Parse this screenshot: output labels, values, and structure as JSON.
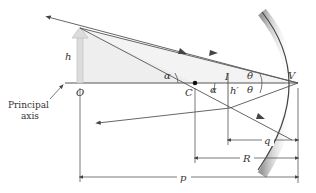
{
  "labels": {
    "object_height": "h",
    "object_point": "O",
    "center_of_curvature": "C",
    "image_point": "I",
    "image_height": "h′",
    "vertex": "V",
    "angle_alpha_left": "α",
    "angle_alpha_right": "α",
    "angle_theta_upper": "θ",
    "angle_theta_lower": "θ",
    "principal_axis_line1": "Principal",
    "principal_axis_line2": "axis",
    "image_distance": "q",
    "radius": "R",
    "object_distance": "p"
  },
  "colors": {
    "line": "#555555",
    "object_arrow": "#d8d8d8",
    "shade": "#ececec",
    "mirror_back": "#bbbbbb"
  }
}
